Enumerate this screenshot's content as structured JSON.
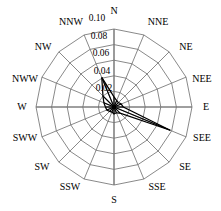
{
  "chart_data": {
    "type": "line",
    "subtype": "wind-rose-polar",
    "title": "",
    "xlabel": "",
    "ylabel": "",
    "grid": true,
    "legend": null,
    "angular_axis": {
      "direction": "clockwise",
      "start_at": "N (top)",
      "categories": [
        "N",
        "NNE",
        "NE",
        "NEE",
        "E",
        "SEE",
        "SE",
        "SSE",
        "S",
        "SSW",
        "SW",
        "SWW",
        "W",
        "NWW",
        "NW",
        "NNW"
      ]
    },
    "radial_axis": {
      "ticks": [
        0.02,
        0.04,
        0.06,
        0.08,
        0.1
      ],
      "tick_labels": [
        "0.02",
        "0.04",
        "0.06",
        "0.08",
        "0.10"
      ],
      "rlim": [
        0,
        0.1
      ],
      "label_angle_deg": 337.5
    },
    "categories": [
      "N",
      "NNE",
      "NE",
      "NEE",
      "E",
      "SEE",
      "SE",
      "SSE",
      "S",
      "SSW",
      "SW",
      "SWW",
      "W",
      "NWW",
      "NW",
      "NNW"
    ],
    "values": [
      0.013,
      0.009,
      0.008,
      0.01,
      0.012,
      0.078,
      0.011,
      0.008,
      0.009,
      0.007,
      0.008,
      0.01,
      0.011,
      0.014,
      0.02,
      0.041
    ]
  },
  "geometry": {
    "center_x": 114,
    "center_y": 107,
    "outer_radius": 78
  },
  "colors": {
    "grid": "#6b6b6b",
    "axis": "#7a7a7a",
    "data": "#000000",
    "background": "#ffffff"
  },
  "labels": {
    "directions": [
      {
        "text": "N",
        "x": 114,
        "y": 11,
        "anchor": "middle"
      },
      {
        "text": "NNE",
        "x": 158,
        "y": 22,
        "anchor": "middle"
      },
      {
        "text": "NE",
        "x": 186,
        "y": 47,
        "anchor": "middle"
      },
      {
        "text": "NEE",
        "x": 202,
        "y": 79,
        "anchor": "middle"
      },
      {
        "text": "E",
        "x": 206,
        "y": 107,
        "anchor": "middle"
      },
      {
        "text": "SEE",
        "x": 202,
        "y": 138,
        "anchor": "middle"
      },
      {
        "text": "SE",
        "x": 185,
        "y": 167,
        "anchor": "middle"
      },
      {
        "text": "SSE",
        "x": 157,
        "y": 187,
        "anchor": "middle"
      },
      {
        "text": "S",
        "x": 114,
        "y": 200,
        "anchor": "middle"
      },
      {
        "text": "SSW",
        "x": 70,
        "y": 187,
        "anchor": "middle"
      },
      {
        "text": "SW",
        "x": 42,
        "y": 167,
        "anchor": "middle"
      },
      {
        "text": "SWW",
        "x": 25,
        "y": 138,
        "anchor": "middle"
      },
      {
        "text": "W",
        "x": 22,
        "y": 107,
        "anchor": "middle"
      },
      {
        "text": "NWW",
        "x": 25,
        "y": 79,
        "anchor": "middle"
      },
      {
        "text": "NW",
        "x": 43,
        "y": 47,
        "anchor": "middle"
      },
      {
        "text": "NNW",
        "x": 71,
        "y": 22,
        "anchor": "middle"
      }
    ],
    "radial": [
      {
        "text": "0.10",
        "x": 97,
        "y": 19
      },
      {
        "text": "0.08",
        "x": 99,
        "y": 37
      },
      {
        "text": "0.06",
        "x": 101,
        "y": 54
      },
      {
        "text": "0.04",
        "x": 102,
        "y": 72
      },
      {
        "text": "0.02",
        "x": 104,
        "y": 89
      }
    ]
  }
}
